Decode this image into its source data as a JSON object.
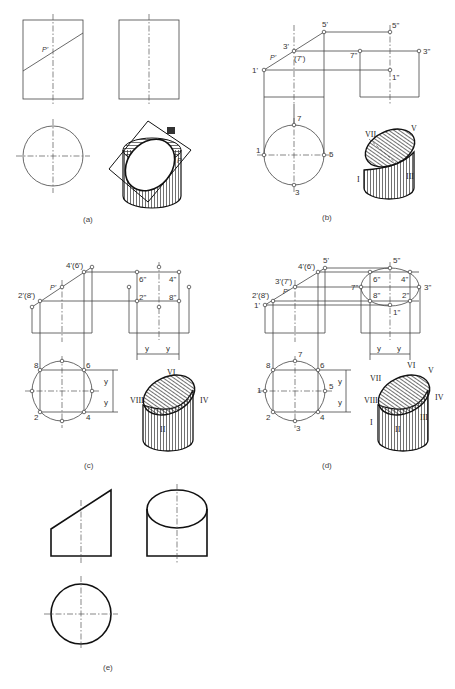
{
  "figures": {
    "a": {
      "caption": "(a)",
      "plane_label": "P'",
      "iso_plane_label": "P"
    },
    "b": {
      "caption": "(b)",
      "front_labels": [
        "1'",
        "3'",
        "(7')",
        "5'",
        "P'"
      ],
      "side_labels": [
        "5\"",
        "7\"",
        "3\"",
        "1\""
      ],
      "top_labels": [
        "1",
        "7",
        "5",
        "3"
      ],
      "iso_labels": [
        "VII",
        "V",
        "I",
        "III"
      ]
    },
    "c": {
      "caption": "(c)",
      "front_labels": [
        "2'(8')",
        "4'(6')",
        "P'"
      ],
      "side_labels": [
        "6\"",
        "4\"",
        "2\"",
        "8\""
      ],
      "top_labels": [
        "8",
        "6",
        "2",
        "4"
      ],
      "dim_label": "y",
      "iso_labels": [
        "VI",
        "VIII",
        "IV",
        "II"
      ]
    },
    "d": {
      "caption": "(d)",
      "front_labels": [
        "1'",
        "2'(8')",
        "3'(7')",
        "4'(6')",
        "5'",
        "P'"
      ],
      "side_labels": [
        "5\"",
        "6\"",
        "4\"",
        "7\"",
        "3\"",
        "8\"",
        "2\"",
        "1\""
      ],
      "top_labels": [
        "1",
        "2",
        "3",
        "4",
        "5",
        "6",
        "7",
        "8"
      ],
      "dim_label": "y",
      "iso_labels": [
        "VI",
        "V",
        "VII",
        "IV",
        "VIII",
        "I",
        "II",
        "III"
      ]
    },
    "e": {
      "caption": "(e)"
    }
  }
}
